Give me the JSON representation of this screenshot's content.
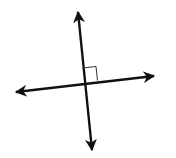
{
  "diagram": {
    "title": "Perpendicular lines",
    "colors": {
      "line": "#111111",
      "background": "#ffffff",
      "right_angle_mark": "#333333"
    },
    "lines": [
      {
        "name": "vertical-line",
        "x1": 78,
        "y1": 10,
        "x2": 92,
        "y2": 152,
        "arrows": "both"
      },
      {
        "name": "horizontal-line",
        "x1": 14,
        "y1": 92,
        "x2": 156,
        "y2": 76,
        "arrows": "both"
      }
    ],
    "intersection": {
      "x": 84,
      "y": 82
    },
    "right_angle_marker": {
      "quadrant": "upper-right",
      "size": 13
    }
  }
}
